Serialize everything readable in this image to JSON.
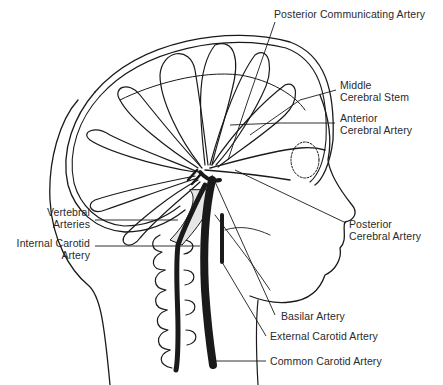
{
  "diagram": {
    "labels": {
      "posterior_communicating": {
        "line1": "Posterior Communicating Artery"
      },
      "middle_cerebral": {
        "line1": "Middle",
        "line2": "Cerebral Stem"
      },
      "anterior_cerebral": {
        "line1": "Anterior",
        "line2": "Cerebral Artery"
      },
      "posterior_cerebral": {
        "line1": "Posterior",
        "line2": "Cerebral Artery"
      },
      "vertebral": {
        "line1": "Vertebral",
        "line2": "Arteries"
      },
      "internal_carotid": {
        "line1": "Internal Carotid",
        "line2": "Artery"
      },
      "basilar": {
        "line1": "Basilar Artery"
      },
      "external_carotid": {
        "line1": "External Carotid Artery"
      },
      "common_carotid": {
        "line1": "Common Carotid Artery"
      }
    },
    "colors": {
      "ink": "#1a1a1a",
      "text": "#2a2a2a",
      "shade": "#e6e6e6",
      "background": "#ffffff"
    }
  }
}
